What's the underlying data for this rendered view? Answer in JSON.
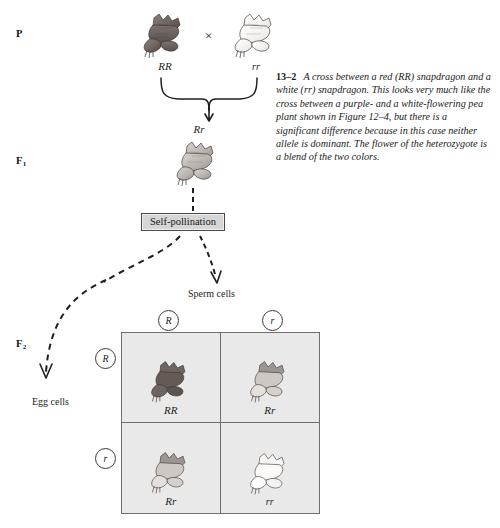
{
  "figure": {
    "number": "13–2",
    "caption": "A cross between a red (RR) snapdragon and a white (rr) snapdragon. This looks very much like the cross between a purple- and a white-flowering pea plant shown in Figure 12–4, but there is a significant difference because in this case neither allele is dominant. The flower of the heterozygote is a blend of the two colors."
  },
  "generations": {
    "parental": {
      "label": "P",
      "label_sub": "",
      "cross_symbol": "×",
      "parent_left_genotype": "RR",
      "parent_right_genotype": "rr",
      "offspring_genotype": "Rr"
    },
    "f1": {
      "label": "F",
      "label_sub": "1",
      "genotype": "Rr",
      "process_label": "Self-pollination"
    },
    "f2": {
      "label": "F",
      "label_sub": "2"
    }
  },
  "gametes": {
    "sperm_label": "Sperm cells",
    "egg_label": "Egg cells",
    "sperm_alleles": [
      "R",
      "r"
    ],
    "egg_alleles": [
      "R",
      "r"
    ]
  },
  "punnett": {
    "cells": [
      {
        "genotype": "RR",
        "phenotype": "red"
      },
      {
        "genotype": "Rr",
        "phenotype": "pink"
      },
      {
        "genotype": "Rr",
        "phenotype": "pink"
      },
      {
        "genotype": "rr",
        "phenotype": "white"
      }
    ]
  },
  "colors": {
    "red_flower": "#6e6460",
    "pink_flower": "#b9b3ae",
    "white_flower": "#f2f0ee",
    "grid_fill": "#e9e9e9",
    "grid_border": "#6f6f6f",
    "box_fill": "#d6d6d6",
    "ink": "#1a1a1a"
  }
}
